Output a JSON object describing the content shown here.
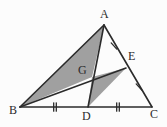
{
  "figure": {
    "kind": "geometry-diagram",
    "canvas": {
      "width": 167,
      "height": 127
    },
    "colors": {
      "background": "#fcfcfc",
      "stroke": "#2b2b2b",
      "shade_fill": "#a0a0a0",
      "label_color": "#2b2b2b"
    },
    "stroke_width": 1.6,
    "points": {
      "A": {
        "x": 104,
        "y": 25
      },
      "B": {
        "x": 20,
        "y": 107
      },
      "C": {
        "x": 152,
        "y": 107
      },
      "D": {
        "x": 88,
        "y": 107
      },
      "E": {
        "x": 126,
        "y": 68
      },
      "G": {
        "x": 92,
        "y": 77
      }
    },
    "labels": [
      {
        "id": "label-A",
        "text": "A",
        "x": 100,
        "y": 8
      },
      {
        "id": "label-B",
        "text": "B",
        "x": 9,
        "y": 104
      },
      {
        "id": "label-C",
        "text": "C",
        "x": 150,
        "y": 108
      },
      {
        "id": "label-D",
        "text": "D",
        "x": 82,
        "y": 110
      },
      {
        "id": "label-E",
        "text": "E",
        "x": 128,
        "y": 50
      },
      {
        "id": "label-G",
        "text": "G",
        "x": 78,
        "y": 64
      }
    ],
    "segments": [
      {
        "id": "side-AB",
        "from": "A",
        "to": "B"
      },
      {
        "id": "side-AC",
        "from": "A",
        "to": "C"
      },
      {
        "id": "side-BC",
        "from": "B",
        "to": "C"
      },
      {
        "id": "median-AD",
        "from": "A",
        "to": "D"
      },
      {
        "id": "median-BE",
        "from": "B",
        "to": "E"
      }
    ],
    "shaded_regions": [
      {
        "id": "shaded-triangle-ABG",
        "vertices": [
          "A",
          "B",
          "G"
        ]
      },
      {
        "id": "shaded-triangle-GDE",
        "vertices": [
          "G",
          "D",
          "E"
        ]
      }
    ],
    "tick_marks": [
      {
        "id": "tick-AE",
        "segment": "AE",
        "count": 1,
        "x": 114,
        "y": 46,
        "angle": -42
      },
      {
        "id": "tick-EC",
        "segment": "EC",
        "count": 1,
        "x": 139,
        "y": 87,
        "angle": -42
      },
      {
        "id": "tick-BD",
        "segment": "BD",
        "count": 2,
        "x": 55,
        "y": 107,
        "angle": 0
      },
      {
        "id": "tick-DC",
        "segment": "DC",
        "count": 2,
        "x": 118,
        "y": 107,
        "angle": 0
      }
    ]
  }
}
